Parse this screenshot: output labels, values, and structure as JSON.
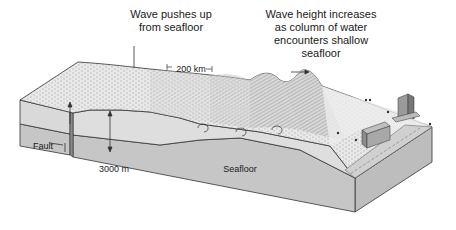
{
  "figure": {
    "type": "block-diagram",
    "labels": {
      "wave_pushes_up": "Wave pushes up\nfrom seafloor",
      "wave_pushes_up_line1": "Wave pushes up",
      "wave_pushes_up_line2": "from seafloor",
      "wave_height_line1": "Wave height increases",
      "wave_height_line2": "as column of water",
      "wave_height_line3": "encounters shallow",
      "wave_height_line4": "seafloor",
      "wavelength": "200 km",
      "depth": "3000 m",
      "fault": "Fault",
      "seafloor": "Seafloor"
    },
    "colors": {
      "block_side": "#c9c9c9",
      "block_side_dark": "#b5b5b5",
      "water_top": "#e6e6e6",
      "water_section": "#dcdcdc",
      "outline": "#333333",
      "background": "#ffffff"
    }
  }
}
